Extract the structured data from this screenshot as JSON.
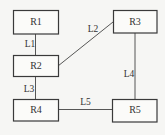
{
  "diagram": {
    "nodes": [
      {
        "id": "R1",
        "label": "R1",
        "x": 13,
        "y": 10,
        "w": 45,
        "h": 24
      },
      {
        "id": "R2",
        "label": "R2",
        "x": 13,
        "y": 55,
        "w": 45,
        "h": 21
      },
      {
        "id": "R3",
        "label": "R3",
        "x": 113,
        "y": 10,
        "w": 44,
        "h": 23
      },
      {
        "id": "R4",
        "label": "R4",
        "x": 13,
        "y": 99,
        "w": 45,
        "h": 22
      },
      {
        "id": "R5",
        "label": "R5",
        "x": 112,
        "y": 99,
        "w": 45,
        "h": 23
      }
    ],
    "links": [
      {
        "id": "L1",
        "label": "L1",
        "from": "R1",
        "to": "R2"
      },
      {
        "id": "L2",
        "label": "L2",
        "from": "R2",
        "to": "R3"
      },
      {
        "id": "L3",
        "label": "L3",
        "from": "R2",
        "to": "R4"
      },
      {
        "id": "L4",
        "label": "L4",
        "from": "R3",
        "to": "R5"
      },
      {
        "id": "L5",
        "label": "L5",
        "from": "R4",
        "to": "R5"
      }
    ]
  }
}
